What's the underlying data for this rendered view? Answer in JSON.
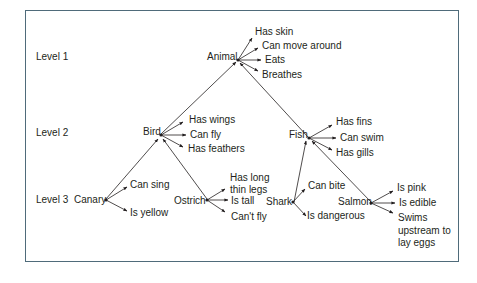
{
  "levels": [
    "Level 1",
    "Level 2",
    "Level 3"
  ],
  "nodes": {
    "animal": {
      "label": "Animal",
      "properties": [
        "Has skin",
        "Can move around",
        "Eats",
        "Breathes"
      ]
    },
    "bird": {
      "label": "Bird",
      "properties": [
        "Has wings",
        "Can fly",
        "Has feathers"
      ]
    },
    "fish": {
      "label": "Fish",
      "properties": [
        "Has fins",
        "Can swim",
        "Has gills"
      ]
    },
    "canary": {
      "label": "Canary",
      "properties": [
        "Can sing",
        "Is yellow"
      ]
    },
    "ostrich": {
      "label": "Ostrich",
      "properties": [
        "Has long thin legs",
        "Is tall",
        "Can't fly"
      ]
    },
    "shark": {
      "label": "Shark",
      "properties": [
        "Can bite",
        "Is dangerous"
      ]
    },
    "salmon": {
      "label": "Salmon",
      "properties": [
        "Is pink",
        "Is edible",
        "Swims upstream to lay eggs"
      ]
    }
  },
  "hierarchy": [
    {
      "child": "Bird",
      "parent": "Animal"
    },
    {
      "child": "Fish",
      "parent": "Animal"
    },
    {
      "child": "Canary",
      "parent": "Bird"
    },
    {
      "child": "Ostrich",
      "parent": "Bird"
    },
    {
      "child": "Shark",
      "parent": "Fish"
    },
    {
      "child": "Salmon",
      "parent": "Fish"
    }
  ],
  "colors": {
    "border": "#4f6b7a",
    "line": "#231f20",
    "text": "#231f20"
  }
}
